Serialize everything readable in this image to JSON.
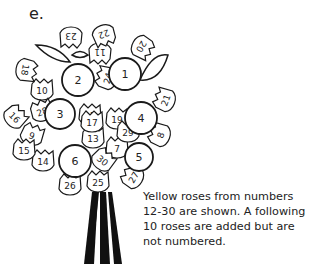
{
  "figure_label": "e.",
  "caption": "Yellow roses from numbers 12-30 are shown. A following 10 roses are added but are not numbered.",
  "colors": {
    "stroke": "#1a1a1a",
    "background": "#ffffff",
    "stems": "#111111"
  },
  "roses": {
    "large": [
      {
        "number": "1",
        "x": 125,
        "y": 74,
        "r": 16
      },
      {
        "number": "2",
        "x": 78,
        "y": 80,
        "r": 16
      },
      {
        "number": "3",
        "x": 60,
        "y": 114,
        "r": 15
      },
      {
        "number": "4",
        "x": 141,
        "y": 118,
        "r": 16
      },
      {
        "number": "5",
        "x": 139,
        "y": 157,
        "r": 14
      },
      {
        "number": "6",
        "x": 75,
        "y": 161,
        "r": 16
      }
    ],
    "small": [
      {
        "number": "7",
        "x": 117,
        "y": 148,
        "rot": 0
      },
      {
        "number": "8",
        "x": 160,
        "y": 135,
        "rot": -70
      },
      {
        "number": "9",
        "x": 32,
        "y": 135,
        "rot": 20
      },
      {
        "number": "10",
        "x": 42,
        "y": 90,
        "rot": 0
      },
      {
        "number": "11",
        "x": 100,
        "y": 53,
        "rot": 180
      },
      {
        "number": "12",
        "x": 90,
        "y": 115,
        "rot": 0
      },
      {
        "number": "13",
        "x": 93,
        "y": 138,
        "rot": 0
      },
      {
        "number": "14",
        "x": 43,
        "y": 161,
        "rot": 0
      },
      {
        "number": "15",
        "x": 24,
        "y": 150,
        "rot": 0
      },
      {
        "number": "16",
        "x": 15,
        "y": 117,
        "rot": 45
      },
      {
        "number": "17",
        "x": 92,
        "y": 122,
        "rot": 0
      },
      {
        "number": "18",
        "x": 26,
        "y": 70,
        "rot": 100
      },
      {
        "number": "19",
        "x": 117,
        "y": 119,
        "rot": 0
      },
      {
        "number": "20",
        "x": 142,
        "y": 47,
        "rot": 120
      },
      {
        "number": "21",
        "x": 165,
        "y": 100,
        "rot": -70
      },
      {
        "number": "22",
        "x": 104,
        "y": 35,
        "rot": 160
      },
      {
        "number": "23",
        "x": 71,
        "y": 37,
        "rot": 180
      },
      {
        "number": "24",
        "x": 107,
        "y": 78,
        "rot": -75
      },
      {
        "number": "25",
        "x": 98,
        "y": 182,
        "rot": 0
      },
      {
        "number": "26",
        "x": 70,
        "y": 185,
        "rot": 0
      },
      {
        "number": "27",
        "x": 133,
        "y": 177,
        "rot": -60
      },
      {
        "number": "28",
        "x": 42,
        "y": 111,
        "rot": -20
      },
      {
        "number": "29",
        "x": 128,
        "y": 132,
        "rot": 0
      },
      {
        "number": "30",
        "x": 103,
        "y": 160,
        "rot": 40
      }
    ]
  }
}
